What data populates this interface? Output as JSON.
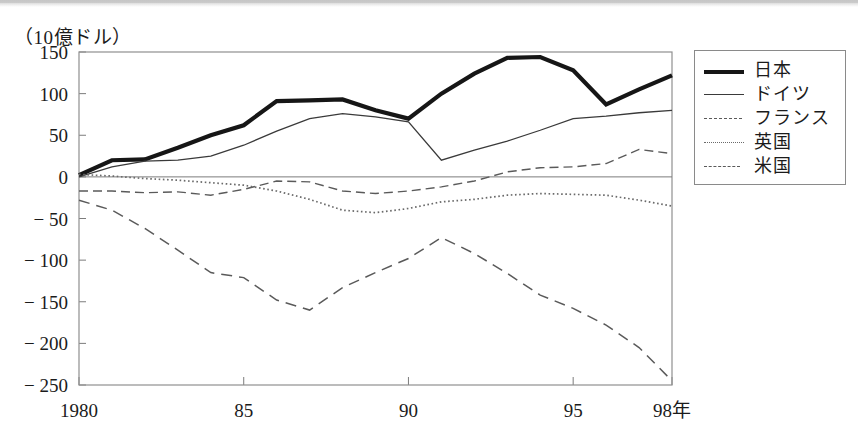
{
  "unit_caption": "（10億ドル）",
  "legend": {
    "items": [
      {
        "label": "日本",
        "style": "thick-solid",
        "sample_name": "legend-sample-japan"
      },
      {
        "label": "ドイツ",
        "style": "thin-solid",
        "sample_name": "legend-sample-germany"
      },
      {
        "label": "フランス",
        "style": "short-dash",
        "sample_name": "legend-sample-france"
      },
      {
        "label": "英国",
        "style": "dotted",
        "sample_name": "legend-sample-uk"
      },
      {
        "label": "米国",
        "style": "long-dash",
        "sample_name": "legend-sample-usa"
      }
    ]
  },
  "chart_data": {
    "type": "line",
    "title": "",
    "subtitle": "",
    "xlabel": "98年",
    "ylabel": "（10億ドル）",
    "xlim": [
      1980,
      1998
    ],
    "ylim": [
      -250,
      150
    ],
    "grid": false,
    "zero_line": true,
    "legend_position": "right-outside",
    "x": [
      1980,
      1981,
      1982,
      1983,
      1984,
      1985,
      1986,
      1987,
      1988,
      1989,
      1990,
      1991,
      1992,
      1993,
      1994,
      1995,
      1996,
      1997,
      1998
    ],
    "x_tick_values": [
      1980,
      1985,
      1990,
      1995,
      1998
    ],
    "x_tick_labels": [
      "1980",
      "85",
      "90",
      "95",
      "98年"
    ],
    "y_tick_values": [
      150,
      100,
      50,
      0,
      -50,
      -100,
      -150,
      -200,
      -250
    ],
    "y_tick_labels": [
      "150",
      "100",
      "50",
      "0",
      "− 50",
      "− 100",
      "− 150",
      "− 200",
      "− 250"
    ],
    "series": [
      {
        "name": "日本",
        "style": "thick-solid",
        "color": "#161616",
        "values": [
          2,
          20,
          21,
          35,
          50,
          62,
          91,
          92,
          93,
          80,
          70,
          100,
          124,
          143,
          144,
          128,
          87,
          105,
          122
        ]
      },
      {
        "name": "ドイツ",
        "style": "thin-solid",
        "color": "#3a3a3a",
        "values": [
          0,
          12,
          19,
          20,
          25,
          38,
          55,
          70,
          76,
          72,
          66,
          20,
          32,
          43,
          56,
          70,
          73,
          77,
          80
        ]
      },
      {
        "name": "フランス",
        "style": "short-dash",
        "color": "#5a5a5a",
        "values": [
          -17,
          -17,
          -19,
          -18,
          -22,
          -15,
          -5,
          -6,
          -17,
          -20,
          -17,
          -12,
          -5,
          6,
          11,
          12,
          16,
          33,
          28
        ]
      },
      {
        "name": "英国",
        "style": "dotted",
        "color": "#6a6a6a",
        "values": [
          3,
          1,
          -2,
          -4,
          -7,
          -10,
          -17,
          -27,
          -40,
          -43,
          -38,
          -30,
          -27,
          -22,
          -20,
          -21,
          -22,
          -28,
          -35
        ]
      },
      {
        "name": "米国",
        "style": "long-dash",
        "color": "#5a5a5a",
        "values": [
          -28,
          -40,
          -62,
          -88,
          -115,
          -121,
          -148,
          -160,
          -133,
          -115,
          -98,
          -73,
          -92,
          -116,
          -142,
          -158,
          -178,
          -205,
          -245
        ]
      }
    ]
  }
}
